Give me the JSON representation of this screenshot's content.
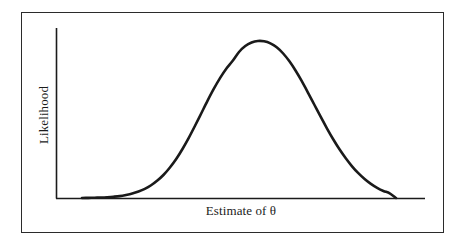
{
  "figure": {
    "background_color": "#ffffff",
    "frame_color": "#2b2b2b",
    "axis_color": "#1b1b1b",
    "curve_color": "#1a1a1a"
  },
  "chart_data": {
    "type": "line",
    "title": "",
    "subtitle": "",
    "xlabel": "Estimate of θ",
    "ylabel": "Likelihood",
    "grid": false,
    "legend": null,
    "annotations": [],
    "xlim": [
      0,
      1
    ],
    "ylim": [
      0,
      1
    ],
    "axis_ticks": {
      "x": [],
      "y": []
    },
    "series": [
      {
        "name": "Likelihood",
        "x": [
          0.0,
          0.02,
          0.04,
          0.06,
          0.08,
          0.1,
          0.12,
          0.14,
          0.16,
          0.18,
          0.2,
          0.22,
          0.24,
          0.26,
          0.28,
          0.3,
          0.32,
          0.34,
          0.36,
          0.38,
          0.4,
          0.42,
          0.44,
          0.46,
          0.48,
          0.5,
          0.52,
          0.54,
          0.56,
          0.58,
          0.6,
          0.62,
          0.64,
          0.66,
          0.68,
          0.7,
          0.72,
          0.74,
          0.76,
          0.78,
          0.8,
          0.82,
          0.84,
          0.86,
          0.88,
          0.9,
          0.92,
          0.94,
          0.96,
          0.98,
          1.0
        ],
        "y": [
          0.0,
          0.001,
          0.002,
          0.003,
          0.005,
          0.008,
          0.012,
          0.019,
          0.028,
          0.041,
          0.058,
          0.081,
          0.111,
          0.148,
          0.194,
          0.248,
          0.312,
          0.383,
          0.46,
          0.54,
          0.62,
          0.696,
          0.765,
          0.825,
          0.874,
          0.93,
          0.968,
          0.99,
          1.0,
          0.998,
          0.985,
          0.96,
          0.922,
          0.872,
          0.812,
          0.744,
          0.67,
          0.594,
          0.518,
          0.444,
          0.374,
          0.31,
          0.253,
          0.202,
          0.158,
          0.121,
          0.09,
          0.065,
          0.045,
          0.03,
          0.0
        ]
      }
    ]
  },
  "labels": {
    "x_axis_title": "Estimate of θ",
    "y_axis_title": "Likelihood"
  }
}
